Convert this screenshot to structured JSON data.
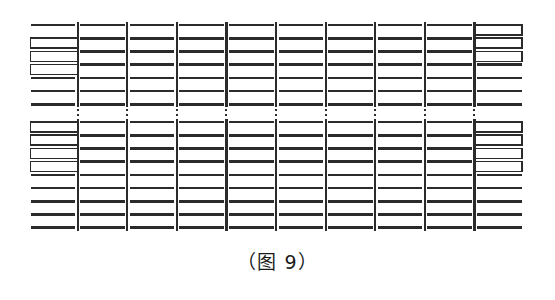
{
  "figure": {
    "caption": "（图 9）",
    "caption_top_px": 247,
    "caption_font_size_px": 19,
    "stroke_color": "#2b2b2b",
    "background_color": "#ffffff",
    "columns": 10,
    "column_left_px": 28,
    "column_right_px": 524,
    "column_pitch_px": 49.6,
    "top_block": {
      "row_count": 7,
      "first_row_y_px": 25,
      "row_pitch_px": 13.2,
      "open_right_rect_rows": [
        1,
        2,
        3
      ],
      "open_left_rect_rows": [
        0,
        1,
        2
      ]
    },
    "bottom_block": {
      "row_count": 9,
      "first_row_y_px": 122,
      "row_pitch_px": 13.2,
      "open_right_rect_rows": [
        0,
        1,
        2,
        3
      ],
      "open_left_rect_rows": [
        0,
        1,
        2,
        3
      ]
    },
    "gap": {
      "dotted_from_y_px": 105,
      "dotted_to_y_px": 120,
      "dot_count": 4
    },
    "line_weights": {
      "horizontal_px": 2.6,
      "vertical_px": 2.2,
      "rect_outline_px": 1.6
    },
    "labels": {
      "first_column_name": "open-right-rectangles-column",
      "last_column_name": "open-left-rectangles-column",
      "middle_column_name": "plain-segment-column",
      "separator_name": "column-separator-line",
      "ellipsis_name": "vertical-ellipsis-dots"
    }
  },
  "chart_data": {
    "type": "diagram",
    "title": "（图 9）",
    "columns": 10,
    "top_block_rows": 7,
    "bottom_block_rows": 9,
    "xlabel": "",
    "ylabel": "",
    "grid": false,
    "legend": "none"
  }
}
